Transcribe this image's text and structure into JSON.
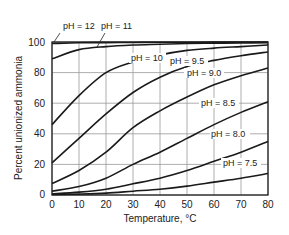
{
  "chart_data": {
    "type": "line",
    "title": "",
    "xlabel": "Temperature, °C",
    "ylabel": "Percent unionized ammonia",
    "xlim": [
      0,
      80
    ],
    "ylim": [
      0,
      100
    ],
    "xticks": [
      0,
      10,
      20,
      30,
      40,
      50,
      60,
      70,
      80
    ],
    "yticks": [
      0,
      20,
      40,
      60,
      80,
      100
    ],
    "grid": true,
    "legend": "inline labels",
    "x": [
      0,
      10,
      20,
      30,
      40,
      50,
      60,
      70,
      80
    ],
    "series": [
      {
        "name": "pH = 12",
        "values": [
          99,
          99.5,
          99.6,
          99.7,
          99.8,
          99.8,
          99.9,
          99.9,
          99.9
        ]
      },
      {
        "name": "pH = 11",
        "values": [
          89,
          95,
          97,
          98,
          98.5,
          99,
          99.2,
          99.4,
          99.5
        ]
      },
      {
        "name": "pH = 10",
        "values": [
          46,
          65,
          80,
          87,
          91.5,
          94.5,
          96,
          97,
          98
        ]
      },
      {
        "name": "pH = 9.5",
        "values": [
          21,
          37,
          53,
          67,
          77,
          84,
          88,
          91,
          93.5
        ]
      },
      {
        "name": "pH = 9.0",
        "values": [
          7.5,
          16,
          28,
          44,
          55,
          64,
          72,
          78,
          83
        ]
      },
      {
        "name": "pH = 8.5",
        "values": [
          2.5,
          5.5,
          11,
          20,
          28,
          37,
          46,
          54,
          61
        ]
      },
      {
        "name": "pH = 8.0",
        "values": [
          0.8,
          1.9,
          3.8,
          7.3,
          11,
          16,
          22,
          28,
          35
        ]
      },
      {
        "name": "pH = 7.5",
        "values": [
          0.3,
          0.6,
          1.2,
          2.5,
          3.8,
          5.8,
          8.4,
          11,
          14
        ]
      }
    ]
  },
  "labels": {
    "ph12": "pH = 12",
    "ph11": "pH = 11",
    "ph10": "pH = 10",
    "ph95": "pH = 9.5",
    "ph90": "pH = 9.0",
    "ph85": "pH = 8.5",
    "ph80": "pH = 8.0",
    "ph75": "pH = 7.5"
  },
  "axes": {
    "xlabel": "Temperature, °C",
    "ylabel": "Percent unionized ammonia",
    "xticks": [
      "0",
      "10",
      "20",
      "30",
      "40",
      "50",
      "60",
      "70",
      "80"
    ],
    "yticks": [
      "0",
      "20",
      "40",
      "60",
      "80",
      "100"
    ]
  }
}
